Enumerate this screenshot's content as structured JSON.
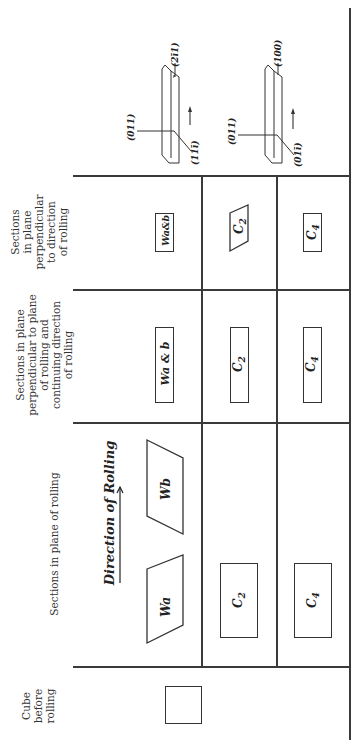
{
  "table": {
    "orientation": "rotated-90-ccw",
    "headers": [
      {
        "id": "cube",
        "lines": [
          "Cube",
          "before",
          "rolling"
        ]
      },
      {
        "id": "plane",
        "lines": [
          "Sections in plane of rolling"
        ]
      },
      {
        "id": "perp_cont",
        "lines": [
          "Sections in plane",
          "perpendicular to plane",
          "of rolling and",
          "continuing direction",
          "of rolling"
        ]
      },
      {
        "id": "perp_dir",
        "lines": [
          "Sections",
          "in plane",
          "perpendicular",
          "to direction",
          "of rolling"
        ]
      }
    ],
    "direction_label": "Direction of Rolling",
    "rows": [
      {
        "plane": [
          "Wa",
          "Wb"
        ],
        "perp_cont": "Wa & b",
        "perp_dir": "Wa & b",
        "orientation": {
          "normal": "(011)",
          "direction": "(2ī1)",
          "third": "(11ī)"
        }
      },
      {
        "plane": [
          "C2"
        ],
        "perp_cont": "C2",
        "perp_dir": "C2",
        "orientation": {
          "normal": "(011)",
          "direction": "(100)",
          "third": "(01ī)"
        }
      },
      {
        "plane": [
          "C4"
        ],
        "perp_cont": "C4",
        "perp_dir": "C4"
      }
    ]
  },
  "labels": {
    "wa": "Wa",
    "wb": "Wb",
    "wab_long": "Wa & b",
    "wab_short": "Wa&b",
    "c2_base": "C",
    "c2_sub": "2",
    "c4_base": "C",
    "c4_sub": "4",
    "m_011_a": "(011)",
    "m_2b11": "(2ī1)",
    "m_111b": "(11ī)",
    "m_011_b": "(011)",
    "m_100": "(100)",
    "m_011b": "(01ī)"
  },
  "colors": {
    "ink": "#333333",
    "paper": "#ffffff"
  }
}
